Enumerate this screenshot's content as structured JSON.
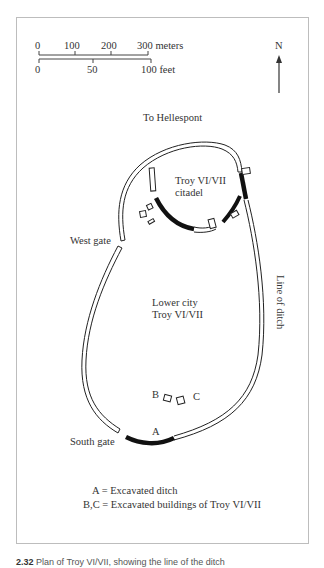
{
  "scale_bar": {
    "meters_ticks": [
      "0",
      "100",
      "200",
      "300 meters"
    ],
    "feet_ticks": [
      "0",
      "50",
      "100 feet"
    ]
  },
  "north_arrow": {
    "label": "N",
    "icon": "north-arrow-icon"
  },
  "map_labels": {
    "to_hellespont": "To Hellespont",
    "citadel_line1": "Troy VI/VII",
    "citadel_line2": "citadel",
    "west_gate": "West gate",
    "lower_city_line1": "Lower city",
    "lower_city_line2": "Troy VI/VII",
    "line_of_ditch": "Line of ditch",
    "marker_a": "A",
    "marker_b": "B",
    "marker_c": "C",
    "south_gate": "South gate"
  },
  "legend": {
    "line1": "A = Excavated ditch",
    "line2": "B,C = Excavated buildings of Troy VI/VII"
  },
  "caption": {
    "number": "2.32",
    "text": "Plan of Troy VI/VII, showing the line of the ditch"
  },
  "colors": {
    "excavated_wall": "#111111",
    "wall_outline": "#222222",
    "frame": "#bdbdbd"
  }
}
